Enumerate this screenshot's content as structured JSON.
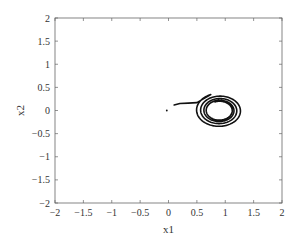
{
  "chart_data": {
    "type": "line",
    "title": "",
    "xlabel": "x1",
    "ylabel": "x2",
    "xlim": [
      -2,
      2
    ],
    "ylim": [
      -2,
      2
    ],
    "xticks": [
      -2,
      -1.5,
      -1,
      -0.5,
      0,
      0.5,
      1,
      1.5,
      2
    ],
    "yticks": [
      -2,
      -1.5,
      -1,
      -0.5,
      0,
      0.5,
      1,
      1.5,
      2
    ],
    "xtick_labels": [
      "−2",
      "−1.5",
      "−1",
      "−0.5",
      "0",
      "0.5",
      "1",
      "1.5",
      "2"
    ],
    "ytick_labels": [
      "−2",
      "−1.5",
      "−1",
      "−0.5",
      "0",
      "0.5",
      "1",
      "1.5",
      "2"
    ],
    "grid": false,
    "legend": null,
    "box": true,
    "series": [
      {
        "name": "phase-trajectory",
        "description": "Trajectory spiraling onto a limit cycle centered near (0.9, 0)",
        "color": "#111111",
        "start_point": [
          -0.03,
          0.0
        ],
        "approach_segment": [
          [
            0.1,
            0.12
          ],
          [
            0.2,
            0.15
          ],
          [
            0.35,
            0.16
          ],
          [
            0.5,
            0.17
          ]
        ],
        "spiral": {
          "center": [
            0.9,
            0.0
          ],
          "outer_radius_x": 0.42,
          "outer_radius_y": 0.37,
          "inner_radius_x": 0.22,
          "inner_radius_y": 0.2,
          "turns": 4
        }
      }
    ]
  },
  "colors": {
    "axis": "#666666",
    "text": "#333333",
    "trajectory": "#111111",
    "background": "#ffffff"
  }
}
